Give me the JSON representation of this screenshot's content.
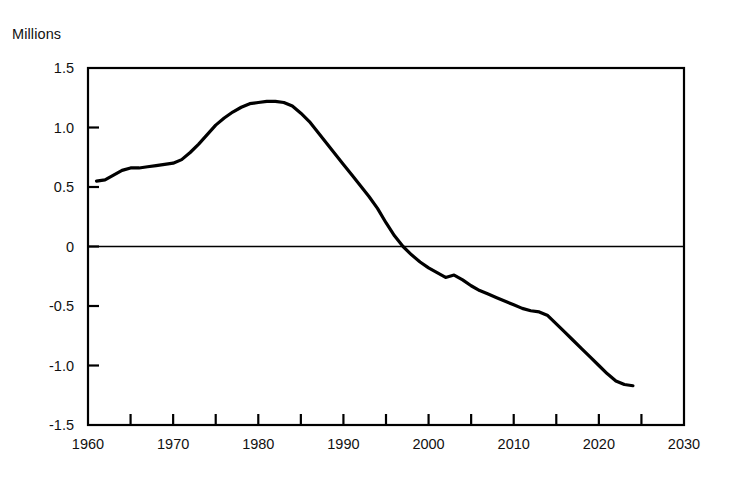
{
  "chart_data": {
    "type": "line",
    "title": "",
    "subtitle": "",
    "ylabel": "Millions",
    "xlabel": "",
    "ylim": [
      -1.5,
      1.5
    ],
    "xlim": [
      1960,
      2030
    ],
    "ytick_labels": [
      "1.5",
      "1.0",
      "0.5",
      "0",
      "-0.5",
      "-1.0",
      "-1.5"
    ],
    "ytick_values": [
      1.5,
      1.0,
      0.5,
      0,
      -0.5,
      -1.0,
      -1.5
    ],
    "xtick_labels": [
      "1960",
      "1970",
      "1980",
      "1990",
      "2000",
      "2010",
      "2020",
      "2030"
    ],
    "xtick_values": [
      1960,
      1970,
      1980,
      1990,
      2000,
      2010,
      2020,
      2030
    ],
    "minor_xtick_values": [
      1965,
      1975,
      1985,
      1995,
      2005,
      2015,
      2025
    ],
    "grid": false,
    "zero_line": true,
    "legend": null,
    "annotations": [],
    "line_color": "#000000",
    "line_width": 3.2,
    "series": [
      {
        "name": "Net change",
        "x": [
          1961,
          1962,
          1963,
          1964,
          1965,
          1966,
          1967,
          1968,
          1969,
          1970,
          1971,
          1972,
          1973,
          1974,
          1975,
          1976,
          1977,
          1978,
          1979,
          1980,
          1981,
          1982,
          1983,
          1984,
          1985,
          1986,
          1987,
          1988,
          1989,
          1990,
          1991,
          1992,
          1993,
          1994,
          1995,
          1996,
          1997,
          1998,
          1999,
          2000,
          2001,
          2002,
          2003,
          2004,
          2005,
          2006,
          2007,
          2008,
          2009,
          2010,
          2011,
          2012,
          2013,
          2014,
          2015,
          2016,
          2017,
          2018,
          2019,
          2020,
          2021,
          2022,
          2023,
          2024
        ],
        "y": [
          0.55,
          0.56,
          0.6,
          0.64,
          0.66,
          0.66,
          0.67,
          0.68,
          0.69,
          0.7,
          0.73,
          0.79,
          0.86,
          0.94,
          1.02,
          1.08,
          1.13,
          1.17,
          1.2,
          1.21,
          1.22,
          1.22,
          1.21,
          1.18,
          1.12,
          1.05,
          0.96,
          0.87,
          0.78,
          0.69,
          0.6,
          0.51,
          0.42,
          0.32,
          0.2,
          0.09,
          0.0,
          -0.07,
          -0.13,
          -0.18,
          -0.22,
          -0.26,
          -0.24,
          -0.28,
          -0.33,
          -0.37,
          -0.4,
          -0.43,
          -0.46,
          -0.49,
          -0.52,
          -0.54,
          -0.55,
          -0.58,
          -0.65,
          -0.72,
          -0.79,
          -0.86,
          -0.93,
          -1.0,
          -1.07,
          -1.13,
          -1.16,
          -1.17
        ]
      }
    ]
  }
}
